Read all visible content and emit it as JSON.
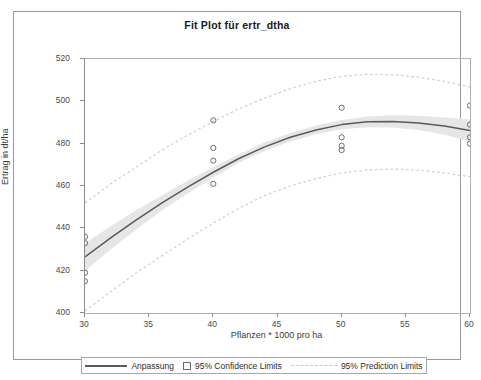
{
  "chart_data": {
    "type": "scatter",
    "title": "Fit Plot für ertr_dtha",
    "xlabel": "Pflanzen * 1000 pro ha",
    "ylabel": "Ertrag in dt/ha",
    "xlim": [
      30,
      60
    ],
    "ylim": [
      400,
      520
    ],
    "xticks": [
      30,
      35,
      40,
      45,
      50,
      55,
      60
    ],
    "yticks": [
      400,
      420,
      440,
      460,
      480,
      500,
      520
    ],
    "grid": false,
    "legend_position": "bottom",
    "points": {
      "x": [
        30,
        30,
        30,
        30,
        40,
        40,
        40,
        40,
        50,
        50,
        50,
        50,
        60,
        60,
        60,
        60
      ],
      "y": [
        436,
        433,
        419,
        415,
        491,
        478,
        472,
        461,
        497,
        483,
        479,
        477,
        498,
        489,
        483,
        480
      ]
    },
    "series": [
      {
        "name": "Anpassung",
        "type": "line",
        "style": "solid",
        "color": "#5a5a5a",
        "x": [
          30,
          32,
          34,
          36,
          38,
          40,
          42,
          44,
          46,
          48,
          50,
          52,
          54,
          56,
          58,
          60
        ],
        "y": [
          426.5,
          435.5,
          444.0,
          452.0,
          459.5,
          466.5,
          473.0,
          478.5,
          483.0,
          486.5,
          489.0,
          490.3,
          490.5,
          489.8,
          488.3,
          486.2
        ]
      },
      {
        "name": "95% Confidence Limits",
        "type": "band",
        "style": "shaded",
        "color": "#e6e6e6",
        "x": [
          30,
          32,
          34,
          36,
          38,
          40,
          42,
          44,
          46,
          48,
          50,
          52,
          54,
          56,
          58,
          60
        ],
        "upper": [
          433.0,
          441.0,
          448.5,
          455.5,
          462.5,
          469.0,
          475.0,
          480.5,
          485.0,
          488.6,
          491.2,
          492.8,
          493.4,
          493.2,
          492.4,
          491.4
        ],
        "lower": [
          420.0,
          430.0,
          439.5,
          448.5,
          456.5,
          464.0,
          471.0,
          476.5,
          481.0,
          484.4,
          486.8,
          487.8,
          487.6,
          486.4,
          484.2,
          481.0
        ]
      },
      {
        "name": "95% Prediction Limits",
        "type": "band-lines",
        "style": "dashed",
        "color": "#d2d2d2",
        "x": [
          30,
          32,
          34,
          36,
          38,
          40,
          42,
          44,
          46,
          48,
          50,
          52,
          54,
          56,
          58,
          60
        ],
        "upper": [
          452.0,
          461.0,
          469.0,
          477.0,
          484.0,
          490.5,
          496.5,
          501.5,
          506.0,
          509.5,
          511.8,
          512.8,
          512.6,
          511.4,
          509.4,
          506.8
        ],
        "lower": [
          401.0,
          410.0,
          419.0,
          427.0,
          435.0,
          442.5,
          449.5,
          455.5,
          460.0,
          463.5,
          466.2,
          467.6,
          468.0,
          467.5,
          466.2,
          464.4
        ]
      }
    ],
    "legend": [
      {
        "label": "Anpassung",
        "marker": "solid-line"
      },
      {
        "label": "95% Confidence Limits",
        "marker": "square"
      },
      {
        "label": "95% Prediction Limits",
        "marker": "dashed-line"
      }
    ],
    "colors": {
      "fit_line": "#5a5a5a",
      "confidence_band": "#e6e6e6",
      "prediction_line": "#d2d2d2",
      "marker_edge": "#6d6d6d",
      "axis": "#8d8d8d",
      "frame": "#9a9a9a",
      "text": "#3c3c3c"
    }
  }
}
